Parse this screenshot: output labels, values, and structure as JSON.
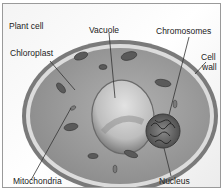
{
  "title": "Plant cell",
  "labels": {
    "vacuole": "Vacuole",
    "chromosomes": "Chromosomes",
    "chloroplast": "Chloroplast",
    "cell_wall_line1": "Cell",
    "cell_wall_line2": "wall",
    "mitochondria": "Mitochondria",
    "nucleus": "Nucleus"
  },
  "colors": {
    "cytoplasm": "#9a9a9a",
    "cell_wall": "#6e6e6e",
    "membrane": "#d8d8d8",
    "vacuole": "#c4c4c4",
    "organelle": "#5a5a5a",
    "leader_line": "#444444"
  }
}
